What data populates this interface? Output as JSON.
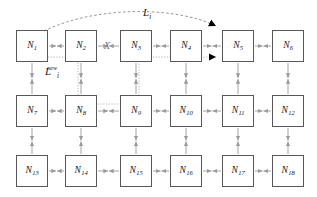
{
  "figure": {
    "type": "network-topology-diagram",
    "background_color": "#ffffff",
    "node_border_color": "#58585a",
    "link_color": "#9a9a9c",
    "arrowhead_color": "#000000",
    "label_color": "#1a1a1a"
  },
  "labels": {
    "original_path": {
      "base": "L",
      "sub": "i",
      "sup": ""
    },
    "new_path": {
      "base": "L",
      "sub": "i",
      "sup": "new"
    },
    "broken_link_marker": "X"
  },
  "nodes": [
    {
      "id": "N1",
      "name": "N",
      "sub": "1",
      "x": 16,
      "y": 30,
      "w": 32,
      "h": 32,
      "row": 0,
      "col": 0
    },
    {
      "id": "N2",
      "name": "N",
      "sub": "2",
      "x": 65,
      "y": 30,
      "w": 32,
      "h": 32,
      "row": 0,
      "col": 1
    },
    {
      "id": "N3",
      "name": "N",
      "sub": "3",
      "x": 120,
      "y": 30,
      "w": 32,
      "h": 32,
      "row": 0,
      "col": 2
    },
    {
      "id": "N4",
      "name": "N",
      "sub": "4",
      "x": 170,
      "y": 30,
      "w": 32,
      "h": 32,
      "row": 0,
      "col": 3
    },
    {
      "id": "N5",
      "name": "N",
      "sub": "5",
      "x": 222,
      "y": 30,
      "w": 32,
      "h": 32,
      "row": 0,
      "col": 4
    },
    {
      "id": "N6",
      "name": "N",
      "sub": "6",
      "x": 272,
      "y": 30,
      "w": 32,
      "h": 32,
      "row": 0,
      "col": 5
    },
    {
      "id": "N7",
      "name": "N",
      "sub": "7",
      "x": 16,
      "y": 95,
      "w": 32,
      "h": 32,
      "row": 1,
      "col": 0
    },
    {
      "id": "N8",
      "name": "N",
      "sub": "8",
      "x": 65,
      "y": 95,
      "w": 32,
      "h": 32,
      "row": 1,
      "col": 1
    },
    {
      "id": "N9",
      "name": "N",
      "sub": "9",
      "x": 120,
      "y": 95,
      "w": 32,
      "h": 32,
      "row": 1,
      "col": 2
    },
    {
      "id": "N10",
      "name": "N",
      "sub": "10",
      "x": 170,
      "y": 95,
      "w": 32,
      "h": 32,
      "row": 1,
      "col": 3
    },
    {
      "id": "N11",
      "name": "N",
      "sub": "11",
      "x": 222,
      "y": 95,
      "w": 32,
      "h": 32,
      "row": 1,
      "col": 4
    },
    {
      "id": "N12",
      "name": "N",
      "sub": "12",
      "x": 272,
      "y": 95,
      "w": 32,
      "h": 32,
      "row": 1,
      "col": 5
    },
    {
      "id": "N13",
      "name": "N",
      "sub": "13",
      "x": 16,
      "y": 155,
      "w": 32,
      "h": 32,
      "row": 2,
      "col": 0
    },
    {
      "id": "N14",
      "name": "N",
      "sub": "14",
      "x": 65,
      "y": 155,
      "w": 32,
      "h": 32,
      "row": 2,
      "col": 1
    },
    {
      "id": "N15",
      "name": "N",
      "sub": "15",
      "x": 120,
      "y": 155,
      "w": 32,
      "h": 32,
      "row": 2,
      "col": 2
    },
    {
      "id": "N16",
      "name": "N",
      "sub": "16",
      "x": 170,
      "y": 155,
      "w": 32,
      "h": 32,
      "row": 2,
      "col": 3
    },
    {
      "id": "N17",
      "name": "N",
      "sub": "17",
      "x": 222,
      "y": 155,
      "w": 32,
      "h": 32,
      "row": 2,
      "col": 4
    },
    {
      "id": "N18",
      "name": "N",
      "sub": "18",
      "x": 272,
      "y": 155,
      "w": 32,
      "h": 32,
      "row": 2,
      "col": 5
    }
  ],
  "horizontal_links": [
    {
      "from": "N1",
      "to": "N2",
      "y": 46,
      "x1": 48,
      "x2": 65
    },
    {
      "from": "N2",
      "to": "N3",
      "y": 46,
      "x1": 97,
      "x2": 120,
      "broken": true
    },
    {
      "from": "N3",
      "to": "N4",
      "y": 46,
      "x1": 152,
      "x2": 170
    },
    {
      "from": "N4",
      "to": "N5",
      "y": 46,
      "x1": 202,
      "x2": 222
    },
    {
      "from": "N5",
      "to": "N6",
      "y": 46,
      "x1": 254,
      "x2": 272
    },
    {
      "from": "N7",
      "to": "N8",
      "y": 111,
      "x1": 48,
      "x2": 65
    },
    {
      "from": "N8",
      "to": "N9",
      "y": 111,
      "x1": 97,
      "x2": 120
    },
    {
      "from": "N9",
      "to": "N10",
      "y": 111,
      "x1": 152,
      "x2": 170
    },
    {
      "from": "N10",
      "to": "N11",
      "y": 111,
      "x1": 202,
      "x2": 222
    },
    {
      "from": "N11",
      "to": "N12",
      "y": 111,
      "x1": 254,
      "x2": 272
    },
    {
      "from": "N13",
      "to": "N14",
      "y": 171,
      "x1": 48,
      "x2": 65
    },
    {
      "from": "N14",
      "to": "N15",
      "y": 171,
      "x1": 97,
      "x2": 120
    },
    {
      "from": "N15",
      "to": "N16",
      "y": 171,
      "x1": 152,
      "x2": 170
    },
    {
      "from": "N16",
      "to": "N17",
      "y": 171,
      "x1": 202,
      "x2": 222
    },
    {
      "from": "N17",
      "to": "N18",
      "y": 171,
      "x1": 254,
      "x2": 272
    }
  ],
  "vertical_links": [
    {
      "from": "N1",
      "to": "N7",
      "x": 32,
      "y1": 62,
      "y2": 95
    },
    {
      "from": "N2",
      "to": "N8",
      "x": 81,
      "y1": 62,
      "y2": 95
    },
    {
      "from": "N3",
      "to": "N9",
      "x": 136,
      "y1": 62,
      "y2": 95
    },
    {
      "from": "N4",
      "to": "N10",
      "x": 186,
      "y1": 62,
      "y2": 95
    },
    {
      "from": "N5",
      "to": "N11",
      "x": 238,
      "y1": 62,
      "y2": 95
    },
    {
      "from": "N6",
      "to": "N12",
      "x": 288,
      "y1": 62,
      "y2": 95
    },
    {
      "from": "N7",
      "to": "N13",
      "x": 32,
      "y1": 127,
      "y2": 155
    },
    {
      "from": "N8",
      "to": "N14",
      "x": 81,
      "y1": 127,
      "y2": 155
    },
    {
      "from": "N9",
      "to": "N15",
      "x": 136,
      "y1": 127,
      "y2": 155
    },
    {
      "from": "N10",
      "to": "N16",
      "x": 186,
      "y1": 127,
      "y2": 155
    },
    {
      "from": "N11",
      "to": "N17",
      "x": 238,
      "y1": 127,
      "y2": 155
    },
    {
      "from": "N12",
      "to": "N18",
      "x": 288,
      "y1": 127,
      "y2": 155
    }
  ],
  "original_path_route": [
    "N1",
    "N2",
    "N3",
    "N4",
    "N5"
  ],
  "new_path_route": [
    "N1",
    "N2",
    "N8",
    "N9",
    "N3",
    "N4",
    "N5"
  ]
}
